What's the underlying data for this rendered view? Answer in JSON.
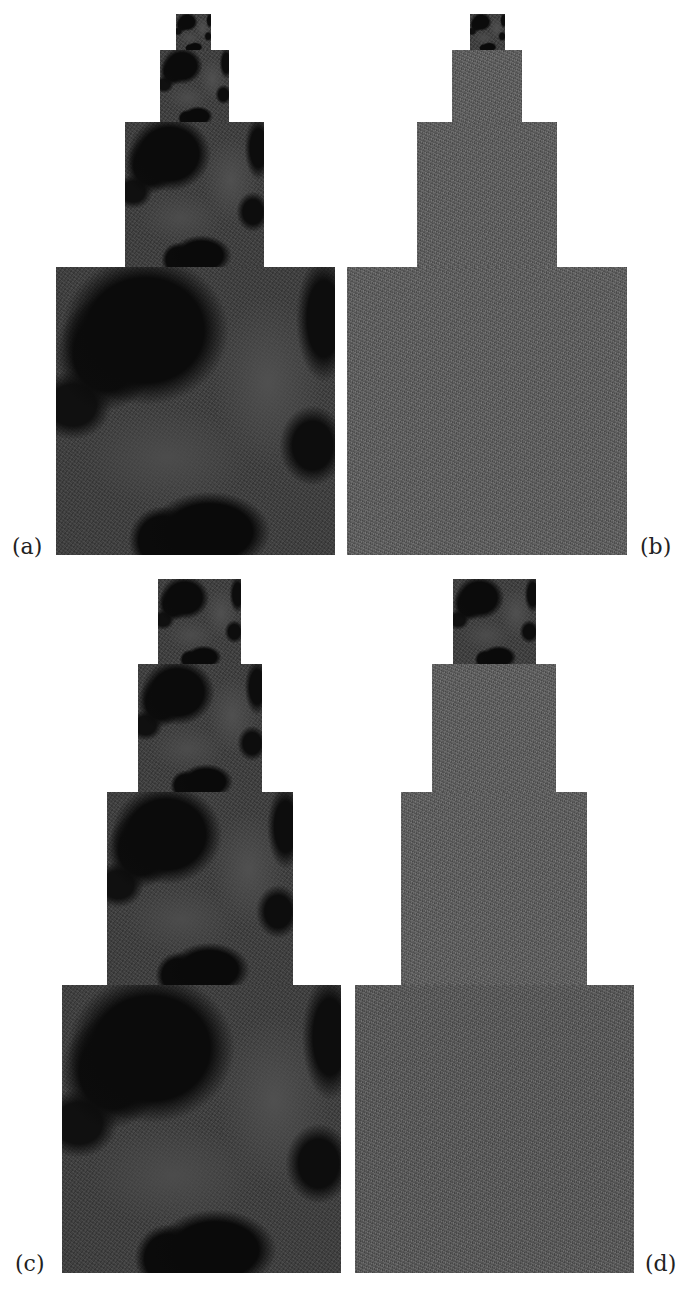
{
  "figure": {
    "panels": [
      {
        "id": "a",
        "label": "(a)",
        "label_pos": {
          "x": 12,
          "y": 536
        },
        "levels": [
          {
            "x": 176,
            "y": 14,
            "w": 35,
            "h": 36,
            "texture": "image"
          },
          {
            "x": 160,
            "y": 50,
            "w": 69,
            "h": 72,
            "texture": "image"
          },
          {
            "x": 125,
            "y": 122,
            "w": 139,
            "h": 145,
            "texture": "image"
          },
          {
            "x": 56,
            "y": 267,
            "w": 279,
            "h": 288,
            "texture": "image"
          }
        ]
      },
      {
        "id": "b",
        "label": "(b)",
        "label_pos": {
          "x": 640,
          "y": 536
        },
        "levels": [
          {
            "x": 470,
            "y": 14,
            "w": 35,
            "h": 36,
            "texture": "image"
          },
          {
            "x": 452,
            "y": 50,
            "w": 70,
            "h": 72,
            "texture": "noise"
          },
          {
            "x": 417,
            "y": 122,
            "w": 140,
            "h": 145,
            "texture": "noise"
          },
          {
            "x": 347,
            "y": 267,
            "w": 280,
            "h": 288,
            "texture": "noise"
          }
        ]
      },
      {
        "id": "c",
        "label": "(c)",
        "label_pos": {
          "x": 15,
          "y": 1253
        },
        "levels": [
          {
            "x": 158,
            "y": 579,
            "w": 83,
            "h": 85,
            "texture": "image"
          },
          {
            "x": 138,
            "y": 664,
            "w": 124,
            "h": 128,
            "texture": "image"
          },
          {
            "x": 107,
            "y": 792,
            "w": 186,
            "h": 193,
            "texture": "image"
          },
          {
            "x": 62,
            "y": 985,
            "w": 279,
            "h": 288,
            "texture": "image"
          }
        ]
      },
      {
        "id": "d",
        "label": "(d)",
        "label_pos": {
          "x": 645,
          "y": 1253
        },
        "levels": [
          {
            "x": 453,
            "y": 579,
            "w": 83,
            "h": 85,
            "texture": "image"
          },
          {
            "x": 432,
            "y": 664,
            "w": 124,
            "h": 128,
            "texture": "noise"
          },
          {
            "x": 401,
            "y": 792,
            "w": 186,
            "h": 193,
            "texture": "noise"
          },
          {
            "x": 355,
            "y": 985,
            "w": 279,
            "h": 288,
            "texture": "noise-dark"
          }
        ]
      }
    ]
  },
  "colors": {
    "background": "#ffffff",
    "image_dark": "#0b0b0b",
    "image_land": "#3a3a3a",
    "noise_gray": "#5c5c5c",
    "noise_gray_dark": "#555555",
    "label_text": "#222222"
  }
}
